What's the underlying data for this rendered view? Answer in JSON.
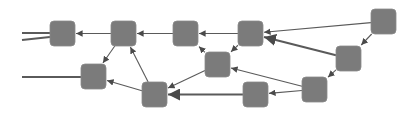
{
  "diagram": {
    "type": "directed-graph",
    "background": "#ffffff",
    "node_color": "#7b7b7b",
    "node_stroke": "#8a8a8a",
    "edge_color": "#5a5a5a",
    "node_size": 25,
    "node_radius": 4,
    "nodes": [
      {
        "id": "A",
        "x": 50,
        "y": 21
      },
      {
        "id": "B",
        "x": 111,
        "y": 21
      },
      {
        "id": "C",
        "x": 173,
        "y": 21
      },
      {
        "id": "F",
        "x": 238,
        "y": 21
      },
      {
        "id": "G",
        "x": 371,
        "y": 9
      },
      {
        "id": "D",
        "x": 81,
        "y": 64
      },
      {
        "id": "K",
        "x": 205,
        "y": 52
      },
      {
        "id": "H",
        "x": 336,
        "y": 46
      },
      {
        "id": "E",
        "x": 142,
        "y": 82
      },
      {
        "id": "J",
        "x": 243,
        "y": 82
      },
      {
        "id": "I",
        "x": 302,
        "y": 77
      }
    ],
    "edges": [
      {
        "from": "B",
        "to": "A",
        "weight": 1
      },
      {
        "from": "C",
        "to": "B",
        "weight": 1
      },
      {
        "from": "F",
        "to": "C",
        "weight": 1
      },
      {
        "from": "G",
        "to": "F",
        "weight": 1
      },
      {
        "from": "H",
        "to": "F",
        "weight": 2
      },
      {
        "from": "B",
        "to": "D",
        "weight": 1
      },
      {
        "from": "E",
        "to": "B",
        "weight": 1
      },
      {
        "from": "E",
        "to": "D",
        "weight": 1
      },
      {
        "from": "K",
        "to": "C",
        "weight": 1
      },
      {
        "from": "F",
        "to": "K",
        "weight": 1
      },
      {
        "from": "K",
        "to": "E",
        "weight": 1
      },
      {
        "from": "J",
        "to": "E",
        "weight": 2
      },
      {
        "from": "I",
        "to": "J",
        "weight": 1
      },
      {
        "from": "I",
        "to": "K",
        "weight": 1
      },
      {
        "from": "G",
        "to": "H",
        "weight": 1
      },
      {
        "from": "H",
        "to": "I",
        "weight": 1
      }
    ],
    "stubs": [
      {
        "x1": 22,
        "y1": 33,
        "x2": 50,
        "y2": 33
      },
      {
        "x1": 22,
        "y1": 40,
        "x2": 50,
        "y2": 37
      },
      {
        "x1": 22,
        "y1": 77,
        "x2": 81,
        "y2": 77
      }
    ]
  }
}
